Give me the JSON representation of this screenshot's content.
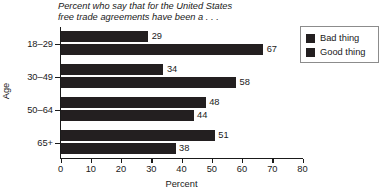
{
  "chart_data": {
    "type": "bar",
    "orientation": "horizontal",
    "title": "Percent who say that for the United States\nfree trade agreements have been a . . .",
    "xlabel": "Percent",
    "ylabel": "Age",
    "xlim": [
      0,
      80
    ],
    "xticks": [
      0,
      10,
      20,
      30,
      40,
      50,
      60,
      70,
      80
    ],
    "grid": false,
    "legend_position": "top-right",
    "categories": [
      "18–29",
      "30–49",
      "50–64",
      "65+"
    ],
    "series": [
      {
        "name": "Bad thing",
        "values": [
          29,
          34,
          48,
          51
        ]
      },
      {
        "name": "Good thing",
        "values": [
          67,
          58,
          44,
          38
        ]
      }
    ],
    "data_labels": {
      "18–29": {
        "bad": "29",
        "good": "67"
      },
      "30–49": {
        "bad": "34",
        "good": "58"
      },
      "50–64": {
        "bad": "48",
        "good": "44"
      },
      "65+": {
        "bad": "51",
        "good": "38"
      }
    }
  },
  "legend": {
    "items": [
      {
        "label": "Bad thing",
        "color": "#231f20"
      },
      {
        "label": "Good thing",
        "color": "#231f20"
      }
    ]
  },
  "axis": {
    "x": {
      "title": "Percent",
      "ticks": [
        "0",
        "10",
        "20",
        "30",
        "40",
        "50",
        "60",
        "70",
        "80"
      ]
    },
    "y": {
      "title": "Age",
      "ticks": [
        "18–29",
        "30–49",
        "50–64",
        "65+"
      ]
    }
  },
  "bars": [
    {
      "category": "18–29",
      "series": "Bad thing",
      "value": 29,
      "label": "29",
      "top": 31,
      "width": 87.7
    },
    {
      "category": "18–29",
      "series": "Good thing",
      "value": 67,
      "label": "67",
      "top": 44,
      "width": 202.7
    },
    {
      "category": "30–49",
      "series": "Bad thing",
      "value": 34,
      "label": "34",
      "top": 64,
      "width": 102.9
    },
    {
      "category": "30–49",
      "series": "Good thing",
      "value": 58,
      "label": "58",
      "top": 77,
      "width": 175.5
    },
    {
      "category": "50–64",
      "series": "Bad thing",
      "value": 48,
      "label": "48",
      "top": 97,
      "width": 145.2
    },
    {
      "category": "50–64",
      "series": "Good thing",
      "value": 44,
      "label": "44",
      "top": 110,
      "width": 133.1
    },
    {
      "category": "65+",
      "series": "Bad thing",
      "value": 51,
      "label": "51",
      "top": 130,
      "width": 154.3
    },
    {
      "category": "65+",
      "series": "Good thing",
      "value": 38,
      "label": "38",
      "top": 143,
      "width": 115.0
    }
  ],
  "ycats": [
    {
      "label": "18–29",
      "top": 39
    },
    {
      "label": "30–49",
      "top": 72
    },
    {
      "label": "50–64",
      "top": 105
    },
    {
      "label": "65+",
      "top": 138
    }
  ],
  "xticks": [
    {
      "label": "0",
      "left": 60.5
    },
    {
      "label": "10",
      "left": 90.8
    },
    {
      "label": "20",
      "left": 121.0
    },
    {
      "label": "30",
      "left": 151.3
    },
    {
      "label": "40",
      "left": 181.5
    },
    {
      "label": "50",
      "left": 211.8
    },
    {
      "label": "60",
      "left": 242.0
    },
    {
      "label": "70",
      "left": 272.3
    },
    {
      "label": "80",
      "left": 302.5
    }
  ]
}
